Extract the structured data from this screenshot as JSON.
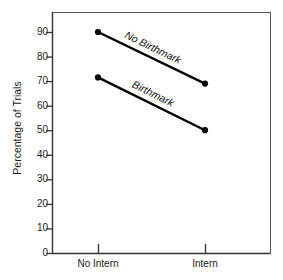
{
  "chart_data": {
    "type": "line",
    "title": "",
    "xlabel": "",
    "ylabel": "Percentage of Trials",
    "categories": [
      "No Intern",
      "Intern"
    ],
    "ylim": [
      0,
      95
    ],
    "yticks": [
      0,
      10,
      20,
      30,
      40,
      50,
      60,
      70,
      80,
      90
    ],
    "ytick_labels": [
      "0",
      "10",
      "20",
      "30",
      "40",
      "50",
      "60",
      "70",
      "80",
      "90"
    ],
    "grid": false,
    "legend_position": "inline",
    "series": [
      {
        "name": "No Birthmark",
        "values": [
          90,
          69
        ]
      },
      {
        "name": "Birthmark",
        "values": [
          71.5,
          50
        ]
      }
    ],
    "annotations": [
      {
        "text": "No Birthmark",
        "series": "No Birthmark"
      },
      {
        "text": "Birthmark",
        "series": "Birthmark"
      }
    ],
    "colors": {
      "line": "#000000",
      "marker": "#000000",
      "frame": "#555555",
      "text": "#1a1a1a",
      "background": "#ffffff"
    }
  }
}
